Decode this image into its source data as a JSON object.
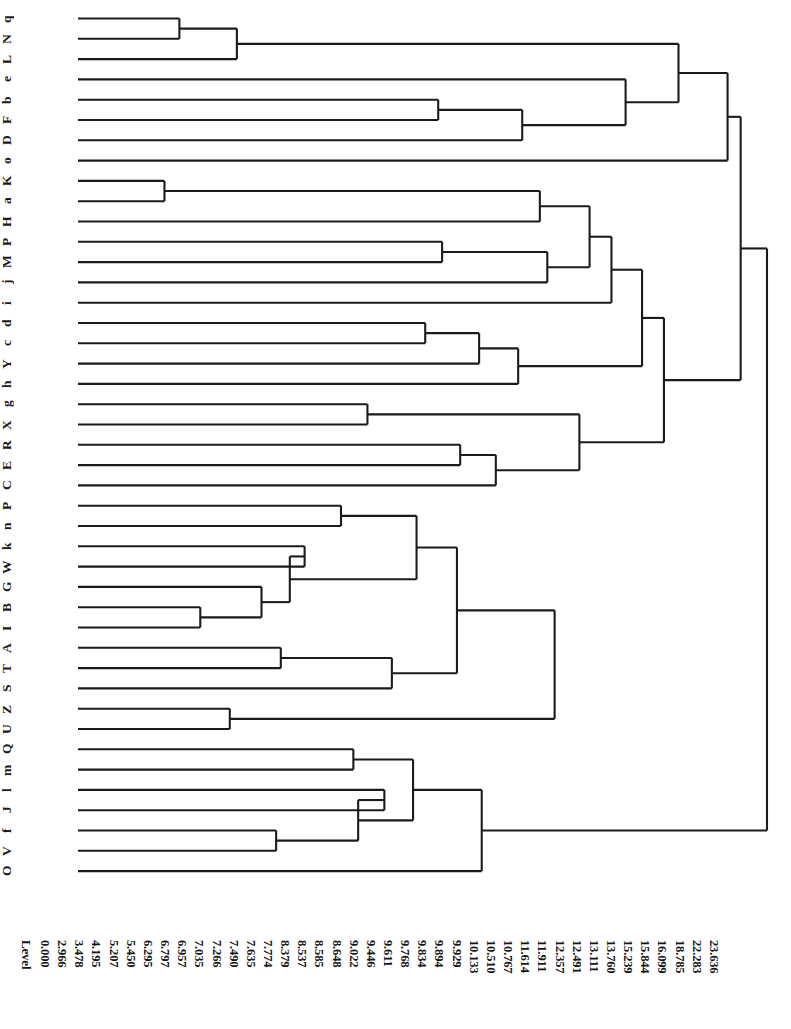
{
  "figure": {
    "type": "dendrogram",
    "orientation": "horizontal-leaves-left",
    "axis_title": "Level",
    "leaf_count": 45,
    "line_color": "#1b1b1b",
    "background": "#ffffff"
  },
  "leaves": [
    "q",
    "N",
    "L",
    "e",
    "b",
    "F",
    "D",
    "o",
    "K",
    "a",
    "H",
    "P",
    "M",
    "j",
    "i",
    "d",
    "c",
    "Y",
    "h",
    "g",
    "X",
    "R",
    "E",
    "C",
    "P",
    "n",
    "k",
    "W",
    "G",
    "B",
    "I",
    "A",
    "T",
    "S",
    "Z",
    "U",
    "Q",
    "m",
    "l",
    "J",
    "f",
    "V",
    "O"
  ],
  "levels": [
    "0.000",
    "2.966",
    "3.478",
    "4.195",
    "5.207",
    "5.450",
    "6.295",
    "6.797",
    "6.957",
    "7.035",
    "7.266",
    "7.490",
    "7.635",
    "7.774",
    "8.379",
    "8.537",
    "8.585",
    "8.648",
    "9.022",
    "9.446",
    "9.611",
    "9.768",
    "9.834",
    "9.894",
    "9.929",
    "10.133",
    "10.510",
    "10.767",
    "11.614",
    "11.911",
    "12.357",
    "12.491",
    "13.111",
    "13.760",
    "15.239",
    "15.844",
    "16.099",
    "18.785",
    "22.283",
    "23.636"
  ],
  "chart_data": {
    "type": "dendrogram",
    "title": "",
    "xlabel": "Level",
    "ylabel": "",
    "xlim": [
      0,
      23.636
    ],
    "grid": false,
    "legend": null,
    "leaf_labels": [
      "q",
      "N",
      "L",
      "e",
      "b",
      "F",
      "D",
      "o",
      "K",
      "a",
      "H",
      "P",
      "M",
      "j",
      "i",
      "d",
      "c",
      "Y",
      "h",
      "g",
      "X",
      "R",
      "E",
      "C",
      "P",
      "n",
      "k",
      "W",
      "G",
      "B",
      "I",
      "A",
      "T",
      "S",
      "Z",
      "U",
      "Q",
      "m",
      "l",
      "J",
      "f",
      "V",
      "O"
    ],
    "level_ticks": [
      0.0,
      2.966,
      3.478,
      4.195,
      5.207,
      5.45,
      6.295,
      6.797,
      6.957,
      7.035,
      7.266,
      7.49,
      7.635,
      7.774,
      8.379,
      8.537,
      8.585,
      8.648,
      9.022,
      9.446,
      9.611,
      9.768,
      9.834,
      9.894,
      9.929,
      10.133,
      10.51,
      10.767,
      11.614,
      11.911,
      12.357,
      12.491,
      13.111,
      13.76,
      15.239,
      15.844,
      16.099,
      18.785,
      22.283,
      23.636
    ],
    "merges": [
      {
        "level": 3.478,
        "members": [
          "q",
          "N"
        ]
      },
      {
        "level": 5.45,
        "members": [
          "q",
          "N",
          "L"
        ]
      },
      {
        "level": 12.357,
        "members": [
          "b",
          "F"
        ]
      },
      {
        "level": 15.239,
        "members": [
          "b",
          "F",
          "D"
        ]
      },
      {
        "level": 18.785,
        "members": [
          "q",
          "N",
          "L",
          "e",
          "b",
          "F",
          "D",
          "o"
        ]
      },
      {
        "level": 2.966,
        "members": [
          "K",
          "a"
        ]
      },
      {
        "level": 15.844,
        "members": [
          "K",
          "a",
          "H"
        ]
      },
      {
        "level": 12.491,
        "members": [
          "P",
          "M"
        ]
      },
      {
        "level": 16.099,
        "members": [
          "P",
          "M",
          "j",
          "i"
        ]
      },
      {
        "level": 11.911,
        "members": [
          "d",
          "c"
        ]
      },
      {
        "level": 13.76,
        "members": [
          "d",
          "c",
          "Y",
          "h"
        ]
      },
      {
        "level": 9.929,
        "members": [
          "g",
          "X"
        ]
      },
      {
        "level": 13.111,
        "members": [
          "R",
          "E"
        ]
      },
      {
        "level": 10.133,
        "members": [
          "E",
          "C"
        ]
      },
      {
        "level": 22.283,
        "members": [
          "top-cluster-a",
          "top-cluster-b"
        ]
      },
      {
        "level": 9.022,
        "members": [
          "P",
          "n"
        ]
      },
      {
        "level": 7.774,
        "members": [
          "k",
          "W"
        ]
      },
      {
        "level": 4.195,
        "members": [
          "B",
          "I"
        ]
      },
      {
        "level": 6.295,
        "members": [
          "G",
          "B",
          "I"
        ]
      },
      {
        "level": 7.266,
        "members": [
          "k",
          "W",
          "G",
          "B",
          "I"
        ]
      },
      {
        "level": 11.614,
        "members": [
          "P",
          "n",
          "k",
          "W",
          "G",
          "B",
          "I"
        ]
      },
      {
        "level": 6.957,
        "members": [
          "A",
          "T"
        ]
      },
      {
        "level": 10.767,
        "members": [
          "A",
          "T",
          "S"
        ]
      },
      {
        "level": 5.207,
        "members": [
          "Z",
          "U"
        ]
      },
      {
        "level": 9.446,
        "members": [
          "Q",
          "m"
        ]
      },
      {
        "level": 10.51,
        "members": [
          "l",
          "J"
        ]
      },
      {
        "level": 6.797,
        "members": [
          "f",
          "V"
        ]
      },
      {
        "level": 9.611,
        "members": [
          "l",
          "J",
          "f",
          "V"
        ]
      },
      {
        "level": 9.894,
        "members": [
          "Q",
          "m",
          "l",
          "J",
          "f",
          "V"
        ]
      },
      {
        "level": 9.834,
        "members": [
          "Q",
          "m",
          "l",
          "J",
          "f",
          "V",
          "O"
        ]
      },
      {
        "level": 23.636,
        "members": [
          "root"
        ]
      }
    ]
  }
}
